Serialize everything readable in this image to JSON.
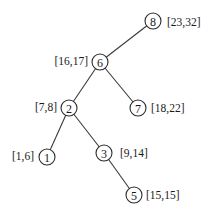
{
  "diagram": {
    "type": "interval-tree",
    "nodes": [
      {
        "id": "8",
        "label": "8",
        "interval": "[23,32]",
        "x": 153,
        "y": 21,
        "interval_side": "right"
      },
      {
        "id": "6",
        "label": "6",
        "interval": "[16,17]",
        "x": 100,
        "y": 62,
        "interval_side": "left"
      },
      {
        "id": "2",
        "label": "2",
        "interval": "[7,8]",
        "x": 69,
        "y": 108,
        "interval_side": "left"
      },
      {
        "id": "7",
        "label": "7",
        "interval": "[18,22]",
        "x": 138,
        "y": 108,
        "interval_side": "right"
      },
      {
        "id": "1",
        "label": "1",
        "interval": "[1,6]",
        "x": 47,
        "y": 157,
        "interval_side": "left"
      },
      {
        "id": "3",
        "label": "3",
        "interval": "[9,14]",
        "x": 104,
        "y": 153,
        "interval_side": "right"
      },
      {
        "id": "5",
        "label": "5",
        "interval": "[15,15]",
        "x": 134,
        "y": 195,
        "interval_side": "right"
      }
    ],
    "edges": [
      {
        "from": "8",
        "to": "6"
      },
      {
        "from": "6",
        "to": "2"
      },
      {
        "from": "6",
        "to": "7"
      },
      {
        "from": "2",
        "to": "1"
      },
      {
        "from": "2",
        "to": "3"
      },
      {
        "from": "3",
        "to": "5"
      }
    ]
  }
}
